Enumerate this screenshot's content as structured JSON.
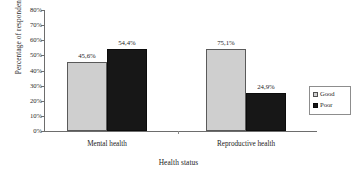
{
  "chart_data": {
    "type": "bar",
    "title": "",
    "xlabel": "Health status",
    "ylabel": "Percentage of respondent",
    "categories": [
      "Mental health",
      "Reproductive health"
    ],
    "series": [
      {
        "name": "Good",
        "color": "#cfcfcf",
        "values": [
          45.6,
          54.4
        ],
        "labels": [
          "45,6%",
          "75,1%"
        ]
      },
      {
        "name": "Poor",
        "color": "#171717",
        "values": [
          54.4,
          24.9
        ],
        "labels": [
          "54,4%",
          "24,9%"
        ]
      }
    ],
    "data_points": [
      {
        "category": "Mental health",
        "series": "Good",
        "value": 45.6,
        "label": "45,6%"
      },
      {
        "category": "Mental health",
        "series": "Poor",
        "value": 54.4,
        "label": "54,4%"
      },
      {
        "category": "Reproductive health",
        "series": "Good",
        "value": 75.1,
        "label": "75,1%"
      },
      {
        "category": "Reproductive health",
        "series": "Poor",
        "value": 24.9,
        "label": "24,9%"
      }
    ],
    "ylim": [
      0,
      80
    ],
    "ytick_step": 10,
    "ytick_labels": [
      "80%",
      "70%",
      "60%",
      "50%",
      "40%",
      "30%",
      "20%",
      "10%",
      "0%"
    ],
    "ytick_values": [
      80,
      70,
      60,
      50,
      40,
      30,
      20,
      10,
      0
    ],
    "grid": false,
    "legend_position": "right"
  },
  "legend": {
    "items": [
      {
        "label": "Good",
        "swatch": "series-good"
      },
      {
        "label": "Poor",
        "swatch": "series-poor"
      }
    ]
  },
  "axes": {
    "y_title": "Percentage of respondent",
    "x_title": "Health status"
  },
  "bars": [
    {
      "name": "bar-mental-health-good",
      "label": "45,6%"
    },
    {
      "name": "bar-mental-health-poor",
      "label": "54,4%"
    },
    {
      "name": "bar-reproductive-health-good",
      "label": "75,1%"
    },
    {
      "name": "bar-reproductive-health-poor",
      "label": "24,9%"
    }
  ],
  "categories": [
    {
      "label": "Mental health"
    },
    {
      "label": "Reproductive health"
    }
  ]
}
